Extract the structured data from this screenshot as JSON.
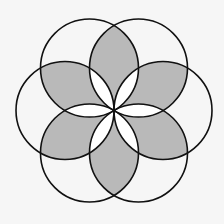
{
  "diagram": {
    "title": "",
    "type": "six-circle rosette",
    "center": [
      114,
      110.5
    ],
    "radius": 49,
    "circle_count": 6,
    "circle_angles_deg": [
      0,
      60,
      120,
      180,
      240,
      300
    ],
    "shaded_regions": "outer lenses between adjacent circles (excluding inner white petals)",
    "colors": {
      "background": "#f6f6f6",
      "shade": "#b9b9b9",
      "petal": "#ffffff",
      "stroke": "#111111"
    },
    "stroke_width": 1.6
  }
}
